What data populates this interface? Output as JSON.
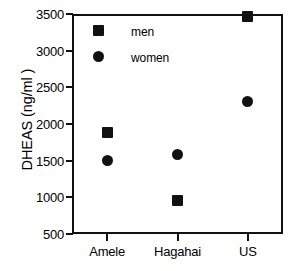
{
  "chart_data": {
    "type": "scatter",
    "title": "",
    "xlabel": "",
    "ylabel": "DHEAS (ng/ml )",
    "categories": [
      "Amele",
      "Hagahai",
      "US"
    ],
    "ylim": [
      500,
      3500
    ],
    "yticks": [
      500,
      1000,
      1500,
      2000,
      2500,
      3000,
      3500
    ],
    "ytick_labels": [
      "500",
      "1000",
      "1500",
      "2000",
      "2500",
      "3000",
      "3500"
    ],
    "grid": false,
    "legend_position": "upper-left-inside",
    "series": [
      {
        "name": "men",
        "marker": "square",
        "color": "#111111",
        "values": [
          1890,
          960,
          3470
        ]
      },
      {
        "name": "women",
        "marker": "circle",
        "color": "#111111",
        "values": [
          1500,
          1580,
          2310
        ]
      }
    ]
  },
  "legend": {
    "entries": [
      {
        "label": "men",
        "marker": "square"
      },
      {
        "label": "women",
        "marker": "circle"
      }
    ]
  }
}
